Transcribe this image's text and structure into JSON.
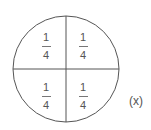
{
  "diagram": {
    "title": "",
    "shape": "circle",
    "divisions": 4,
    "quadrants": [
      {
        "position": "top-left",
        "numerator": "1",
        "denominator": "4"
      },
      {
        "position": "top-right",
        "numerator": "1",
        "denominator": "4"
      },
      {
        "position": "bottom-left",
        "numerator": "1",
        "denominator": "4"
      },
      {
        "position": "bottom-right",
        "numerator": "1",
        "denominator": "4"
      }
    ],
    "label": "(x)",
    "colors": {
      "stroke": "#555555",
      "text": "#555555",
      "background": "#ffffff"
    }
  }
}
